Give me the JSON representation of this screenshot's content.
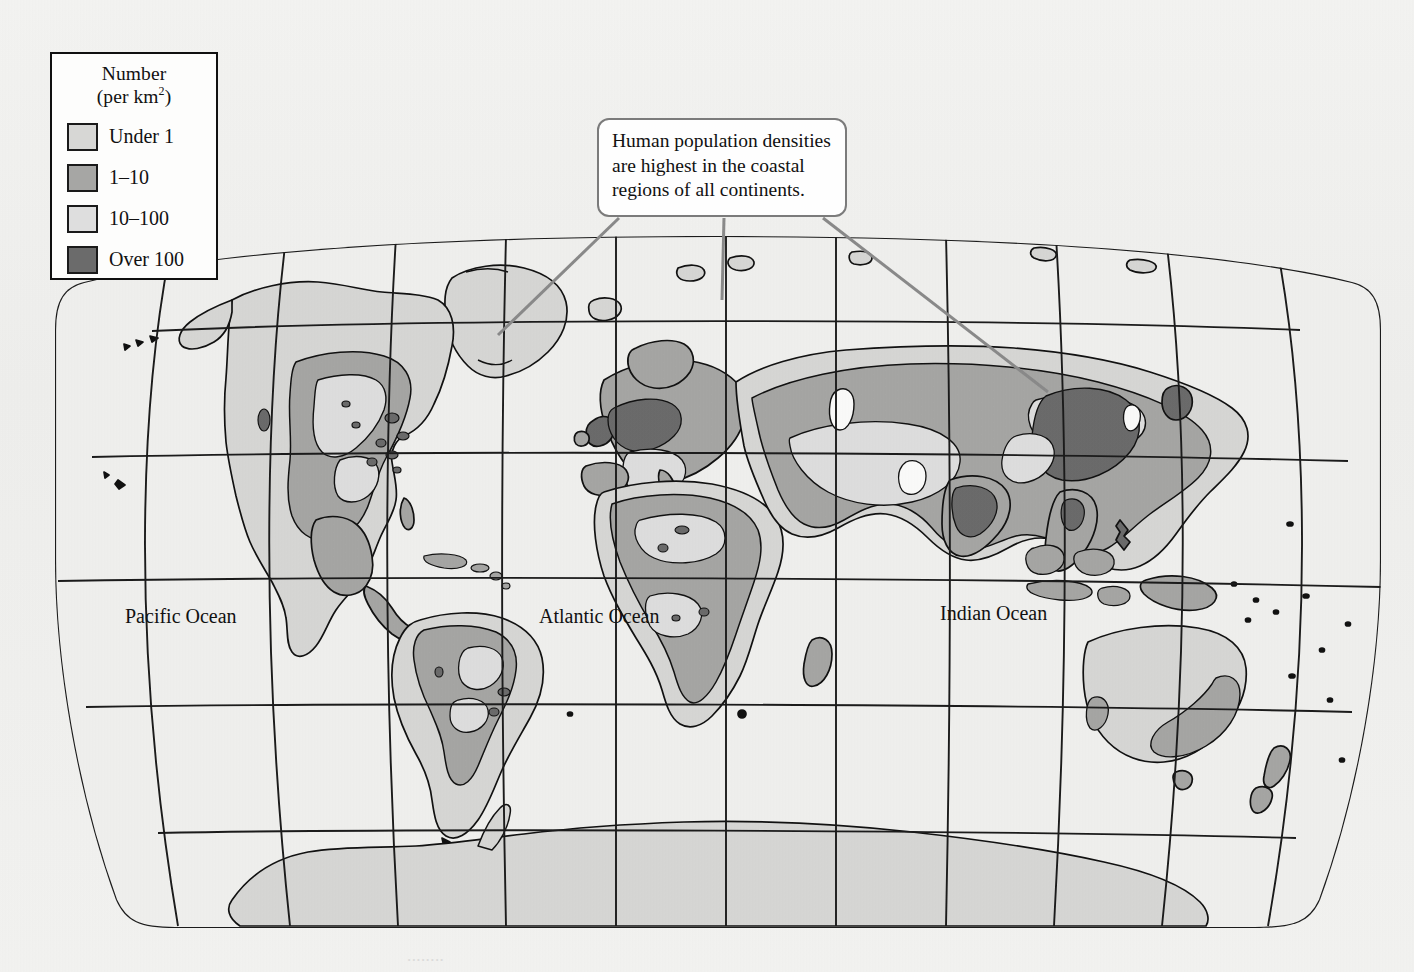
{
  "legend": {
    "title_line1": "Number",
    "title_line2_prefix": "(per km",
    "title_line2_sup": "2",
    "title_line2_suffix": ")",
    "items": [
      {
        "label": "Under 1",
        "color": "#d7d7d5",
        "swatch_name": "swatch-under-1"
      },
      {
        "label": "1–10",
        "color": "#a6a6a4",
        "swatch_name": "swatch-1-10"
      },
      {
        "label": "10–100",
        "color": "#dedede",
        "swatch_name": "swatch-10-100"
      },
      {
        "label": "Over 100",
        "color": "#6b6b6b",
        "swatch_name": "swatch-over-100"
      }
    ]
  },
  "callout": {
    "text": "Human population densities are highest in the coastal regions of all continents."
  },
  "map": {
    "ocean_labels": [
      {
        "name": "Pacific Ocean"
      },
      {
        "name": "Atlantic Ocean"
      },
      {
        "name": "Indian Ocean"
      }
    ],
    "projection": "Robinson",
    "graticule": {
      "parallels": 5,
      "meridians": 12,
      "line_color": "#1b1b1b"
    },
    "background_color": "#f1f1ef",
    "ocean_color": "#f0f0ee",
    "outline_color": "#111111"
  },
  "caption_sliver": "........"
}
